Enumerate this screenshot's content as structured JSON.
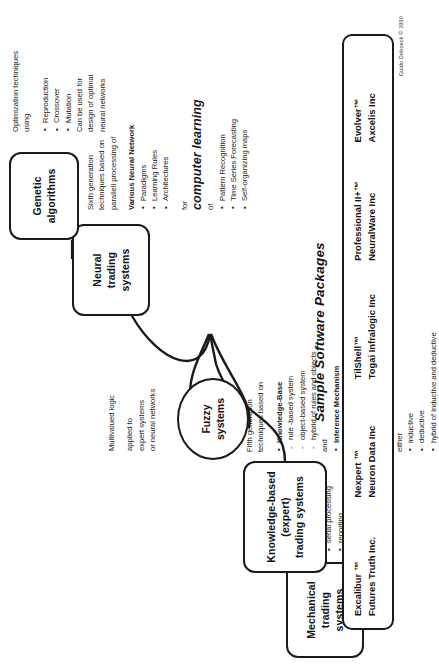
{
  "diagram": {
    "nodes": {
      "mechanical": "Mechanical\ntrading\nsystems",
      "knowledge": "Knowledge-based\n(expert)\ntrading systems",
      "fuzzy": "Fuzzy\nsystems",
      "neural": "Neural\ntrading\nsystems",
      "genetic": "Genetic\nalgorithms"
    },
    "mechanical_notes": {
      "lead1": "Fourth generation",
      "lead2": "techniques based on",
      "bullets": [
        "rules",
        "serial processing",
        "reporting",
        "no inference\nmechanism"
      ]
    },
    "knowledge_notes": {
      "lead1": "Fifth generation",
      "lead2": "techniques based on",
      "kb_header": "Knowledge-Base",
      "kb_items": [
        "rule -based system",
        "object-based system",
        "hybrid of rules and objects"
      ],
      "and": "and",
      "inference": "Inference Mechanism",
      "for": "for",
      "headline": "computer reasoning",
      "either": "either",
      "reasoning_items": [
        "inductive",
        "deductive",
        "hybrid of inductive and  deductive"
      ]
    },
    "fuzzy_notes": {
      "line1": "Multivalued logic",
      "line2": "applied to",
      "line3": "expert systems",
      "line4": "or neural networks"
    },
    "neural_notes": {
      "lead1": "Sixth generation",
      "lead2": "techniques based on",
      "lead3": "parallell processing of",
      "nn_header": "Various Neural Network",
      "nn_items": [
        "Paradigms",
        "Learning Rules",
        "Architectures"
      ],
      "for": "for",
      "headline": "computer learning",
      "of": "of",
      "learning_items": [
        "Pattern Recognition",
        "Time Series Forecasting",
        "Self-organizing maps"
      ]
    },
    "genetic_notes": {
      "lead1": "Optimization techniques",
      "lead2": "using",
      "bullets": [
        "Reproduction",
        "Crossover",
        "Mutation"
      ],
      "tail1": "Can be used for",
      "tail2": "design of  optimal",
      "tail3": "neural networks"
    }
  },
  "packages": {
    "title": "Sample Software Packages",
    "items": [
      {
        "product": "Excalibur ™",
        "vendor": "Futures Truth Inc."
      },
      {
        "product": "Nexpert ™",
        "vendor": "Neuron Data Inc"
      },
      {
        "product": "TilShell™",
        "vendor": "Togai Infralogic Inc"
      },
      {
        "product": "Professional II+™",
        "vendor": "NeuralWare Inc"
      },
      {
        "product": "Evolver™",
        "vendor": "Axcelis Inc"
      }
    ]
  },
  "credit": "Guido Deboeck © 1990"
}
